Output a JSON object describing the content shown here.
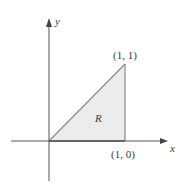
{
  "diagram": {
    "type": "coordinate-region",
    "axes": {
      "x_label": "x",
      "y_label": "y"
    },
    "region": {
      "label": "R",
      "vertices": [
        [
          0,
          0
        ],
        [
          1,
          0
        ],
        [
          1,
          1
        ]
      ],
      "fill_color": "#ececec",
      "edge_color": "#8a8a8a"
    },
    "points": [
      {
        "coords": [
          1,
          1
        ],
        "label": "(1, 1)"
      },
      {
        "coords": [
          1,
          0
        ],
        "label": "(1, 0)"
      }
    ],
    "colors": {
      "axis": "#555555",
      "text": "#3a3a3a",
      "background": "#ffffff"
    }
  }
}
